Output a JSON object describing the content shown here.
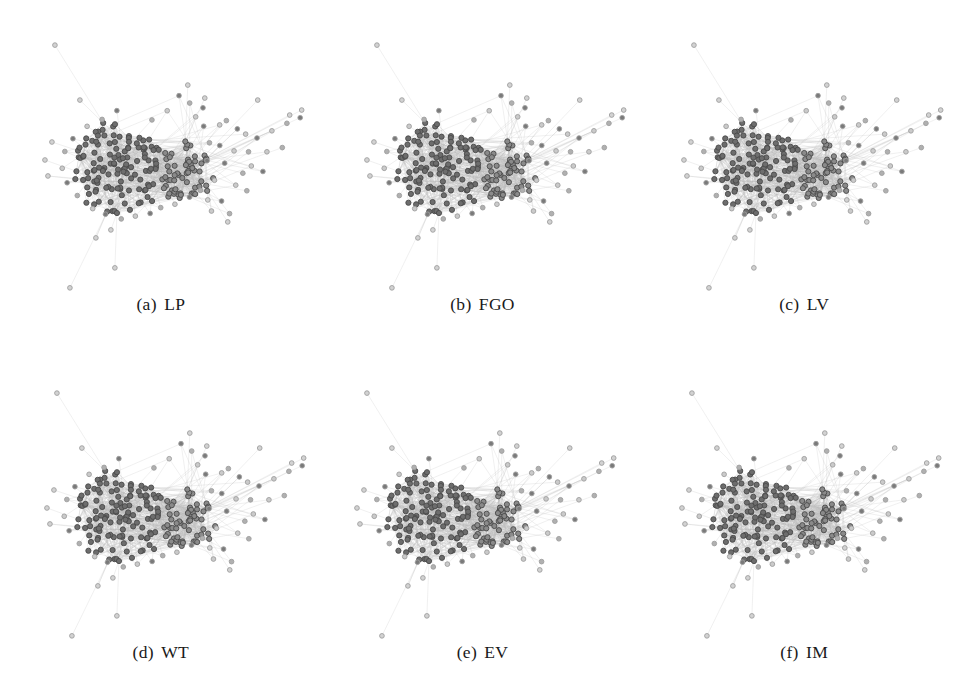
{
  "figure": {
    "type": "network-graph-grid",
    "rows": 2,
    "columns": 3,
    "background": "#ffffff"
  },
  "panels": [
    {
      "index": "(a)",
      "label": "LP",
      "caption": "(a)  LP",
      "name": "label-propagation"
    },
    {
      "index": "(b)",
      "label": "FGO",
      "caption": "(b)  FGO",
      "name": "fast-greedy-optimization"
    },
    {
      "index": "(c)",
      "label": "LV",
      "caption": "(c)  LV",
      "name": "louvain"
    },
    {
      "index": "(d)",
      "label": "WT",
      "caption": "(d)  WT",
      "name": "walktrap"
    },
    {
      "index": "(e)",
      "label": "EV",
      "caption": "(e)  EV",
      "name": "leading-eigenvector"
    },
    {
      "index": "(f)",
      "label": "IM",
      "caption": "(f)  IM",
      "name": "infomap"
    }
  ],
  "graph": {
    "node_count": 232,
    "edge_count": 1120,
    "node_radius": 2.6,
    "node_stroke_width": 0.9,
    "edge_stroke_width": 0.35,
    "edge_color": "#b9b9b9",
    "edge_opacity": 0.62,
    "layout": "force-directed",
    "hub_count": 2,
    "palette": [
      "#6d6d6d",
      "#8a8a8a",
      "#a5a5a5",
      "#bdbdbd",
      "#5a5a5a",
      "#9a9a9a",
      "#cacaca",
      "#7a7a7a",
      "#b0b0b0",
      "#d2d2d2"
    ],
    "node_stroke": "#4a4a4a",
    "light_node_stroke": "#9e9e9e"
  },
  "chart_data": {
    "type": "scatter",
    "title": "",
    "xlabel": "",
    "ylabel": "",
    "series": [
      {
        "name": "(a) LP",
        "communities": 6,
        "nodes": 232
      },
      {
        "name": "(b) FGO",
        "communities": 5,
        "nodes": 232
      },
      {
        "name": "(c) LV",
        "communities": 7,
        "nodes": 232
      },
      {
        "name": "(d) WT",
        "communities": 8,
        "nodes": 232
      },
      {
        "name": "(e) EV",
        "communities": 6,
        "nodes": 232
      },
      {
        "name": "(f) IM",
        "communities": 9,
        "nodes": 232
      }
    ],
    "legend": "none",
    "grid": false
  }
}
